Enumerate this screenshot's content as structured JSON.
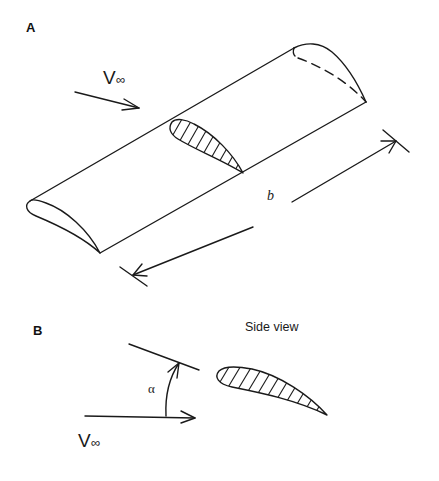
{
  "figure": {
    "panels": [
      {
        "id": "A",
        "label": "A",
        "description": "Isometric view of a rectangular wing of span b with freestream approaching",
        "freestream_label": {
          "symbol": "V",
          "subscript": "∞"
        },
        "span_label": "b",
        "elements": [
          "wing-body",
          "hatched-airfoil-section",
          "tip-airfoil-dashed",
          "span-dimension-arrow",
          "freestream-arrow"
        ]
      },
      {
        "id": "B",
        "label": "B",
        "title": "Side view",
        "description": "Side view of airfoil at angle of attack alpha to freestream",
        "angle_label": "α",
        "freestream_label": {
          "symbol": "V",
          "subscript": "∞"
        },
        "elements": [
          "chord-line",
          "freestream-arrow",
          "angle-arc-arrow",
          "hatched-airfoil"
        ]
      }
    ]
  },
  "colors": {
    "line": "#1a1a1a",
    "background": "#ffffff"
  }
}
